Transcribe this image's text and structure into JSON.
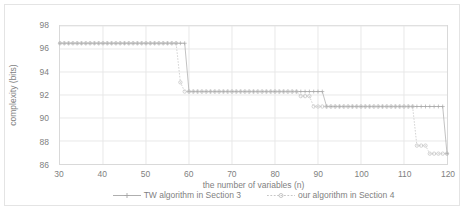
{
  "chart_data": {
    "type": "line",
    "title": "",
    "xlabel": "the number of variables (n)",
    "ylabel": "complexity (bits)",
    "xlim": [
      30,
      120
    ],
    "ylim": [
      86,
      98
    ],
    "xticks": [
      30,
      40,
      50,
      60,
      70,
      80,
      90,
      100,
      110,
      120
    ],
    "yticks": [
      86,
      88,
      90,
      92,
      94,
      96,
      98
    ],
    "grid": true,
    "legend_position": "bottom",
    "series": [
      {
        "name": "TW algorithm in Section 3",
        "marker": "plus",
        "color": "#a6a6a6",
        "x": [
          30,
          31,
          32,
          33,
          34,
          35,
          36,
          37,
          38,
          39,
          40,
          41,
          42,
          43,
          44,
          45,
          46,
          47,
          48,
          49,
          50,
          51,
          52,
          53,
          54,
          55,
          56,
          57,
          58,
          59,
          60,
          61,
          62,
          63,
          64,
          65,
          66,
          67,
          68,
          69,
          70,
          71,
          72,
          73,
          74,
          75,
          76,
          77,
          78,
          79,
          80,
          81,
          82,
          83,
          84,
          85,
          86,
          87,
          88,
          89,
          90,
          91,
          92,
          93,
          94,
          95,
          96,
          97,
          98,
          99,
          100,
          101,
          102,
          103,
          104,
          105,
          106,
          107,
          108,
          109,
          110,
          111,
          112,
          113,
          114,
          115,
          116,
          117,
          118,
          119,
          120
        ],
        "y": [
          96.5,
          96.5,
          96.5,
          96.5,
          96.5,
          96.5,
          96.5,
          96.5,
          96.5,
          96.5,
          96.5,
          96.5,
          96.5,
          96.5,
          96.5,
          96.5,
          96.5,
          96.5,
          96.5,
          96.5,
          96.5,
          96.5,
          96.5,
          96.5,
          96.5,
          96.5,
          96.5,
          96.5,
          96.5,
          96.5,
          92.3,
          92.3,
          92.3,
          92.3,
          92.3,
          92.3,
          92.3,
          92.3,
          92.3,
          92.3,
          92.3,
          92.3,
          92.3,
          92.3,
          92.3,
          92.3,
          92.3,
          92.3,
          92.3,
          92.3,
          92.3,
          92.3,
          92.3,
          92.3,
          92.3,
          92.3,
          92.3,
          92.3,
          92.3,
          92.3,
          92.3,
          92.3,
          91.0,
          91.0,
          91.0,
          91.0,
          91.0,
          91.0,
          91.0,
          91.0,
          91.0,
          91.0,
          91.0,
          91.0,
          91.0,
          91.0,
          91.0,
          91.0,
          91.0,
          91.0,
          91.0,
          91.0,
          91.0,
          91.0,
          91.0,
          91.0,
          91.0,
          91.0,
          91.0,
          91.0,
          86.9
        ]
      },
      {
        "name": "our algorithm in Section 4",
        "marker": "circle",
        "color": "#bfbfbf",
        "x": [
          30,
          31,
          32,
          33,
          34,
          35,
          36,
          37,
          38,
          39,
          40,
          41,
          42,
          43,
          44,
          45,
          46,
          47,
          48,
          49,
          50,
          51,
          52,
          53,
          54,
          55,
          56,
          57,
          58,
          59,
          60,
          61,
          62,
          63,
          64,
          65,
          66,
          67,
          68,
          69,
          70,
          71,
          72,
          73,
          74,
          75,
          76,
          77,
          78,
          79,
          80,
          81,
          82,
          83,
          84,
          85,
          86,
          87,
          88,
          89,
          90,
          91,
          92,
          93,
          94,
          95,
          96,
          97,
          98,
          99,
          100,
          101,
          102,
          103,
          104,
          105,
          106,
          107,
          108,
          109,
          110,
          111,
          112,
          113,
          114,
          115,
          116,
          117,
          118,
          119,
          120
        ],
        "y": [
          96.5,
          96.5,
          96.5,
          96.5,
          96.5,
          96.5,
          96.5,
          96.5,
          96.5,
          96.5,
          96.5,
          96.5,
          96.5,
          96.5,
          96.5,
          96.5,
          96.5,
          96.5,
          96.5,
          96.5,
          96.5,
          96.5,
          96.5,
          96.5,
          96.5,
          96.5,
          96.5,
          96.5,
          93.1,
          92.3,
          92.3,
          92.3,
          92.3,
          92.3,
          92.3,
          92.3,
          92.3,
          92.3,
          92.3,
          92.3,
          92.3,
          92.3,
          92.3,
          92.3,
          92.3,
          92.3,
          92.3,
          92.3,
          92.3,
          92.3,
          92.3,
          92.3,
          92.3,
          92.3,
          92.3,
          92.3,
          91.9,
          91.9,
          91.9,
          91.0,
          91.0,
          91.0,
          91.0,
          91.0,
          91.0,
          91.0,
          91.0,
          91.0,
          91.0,
          91.0,
          91.0,
          91.0,
          91.0,
          91.0,
          91.0,
          91.0,
          91.0,
          91.0,
          91.0,
          91.0,
          91.0,
          91.0,
          91.0,
          87.6,
          87.6,
          87.6,
          86.9,
          86.9,
          86.9,
          86.9,
          86.9
        ]
      }
    ]
  },
  "axes": {
    "ylabel": "complexity (bits)",
    "xlabel": "the number of variables (n)",
    "ytick_labels": [
      "98",
      "96",
      "94",
      "92",
      "90",
      "88",
      "86"
    ],
    "xtick_labels": [
      "30",
      "40",
      "50",
      "60",
      "70",
      "80",
      "90",
      "100",
      "110",
      "120"
    ]
  },
  "legend": {
    "items": [
      {
        "label": "TW algorithm in Section 3",
        "marker": "plus-marker",
        "color": "#a6a6a6"
      },
      {
        "label": "our algorithm in Section 4",
        "marker": "circle-marker",
        "color": "#bfbfbf"
      }
    ]
  },
  "colors": {
    "grid": "#e8e8e8",
    "axis": "#d9d9d9",
    "text": "#7f7f7f",
    "series_tw": "#a6a6a6",
    "series_our": "#bfbfbf"
  }
}
